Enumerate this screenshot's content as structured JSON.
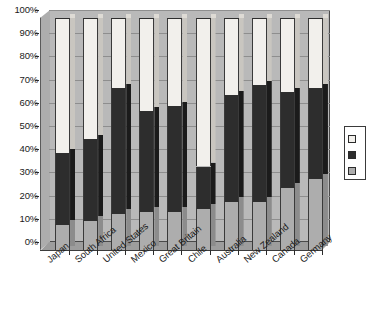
{
  "chart_data": {
    "type": "bar",
    "subtype": "stacked-100-percent",
    "title": "",
    "xlabel": "",
    "ylabel": "",
    "ylim": [
      0,
      100
    ],
    "yticks": [
      "0%",
      "10%",
      "20%",
      "30%",
      "40%",
      "50%",
      "60%",
      "70%",
      "80%",
      "90%",
      "100%"
    ],
    "ytick_values": [
      0,
      10,
      20,
      30,
      40,
      50,
      60,
      70,
      80,
      90,
      100
    ],
    "grid": true,
    "legend_position": "right",
    "categories": [
      "Japan",
      "South Africa",
      "United States",
      "Mexico",
      "Great Britain",
      "Chile",
      "Australia",
      "New Zealand",
      "Canada",
      "Germany"
    ],
    "series": [
      {
        "name": "",
        "swatch": "gray",
        "color": "#adadad",
        "values": [
          11,
          13,
          16,
          17,
          17,
          18,
          21,
          21,
          27,
          31
        ]
      },
      {
        "name": "",
        "swatch": "black",
        "color": "#2d2d2d",
        "values": [
          31,
          35,
          54,
          43,
          45,
          18,
          46,
          50,
          41,
          39
        ]
      },
      {
        "name": "",
        "swatch": "white",
        "color": "#f2f0ec",
        "values": [
          58,
          52,
          30,
          40,
          38,
          64,
          33,
          29,
          32,
          30
        ]
      }
    ],
    "cumulative_tops": {
      "gray": [
        11,
        13,
        16,
        17,
        17,
        18,
        21,
        21,
        27,
        31
      ],
      "black": [
        42,
        48,
        70,
        60,
        62,
        36,
        67,
        71,
        68,
        70
      ],
      "white": [
        100,
        100,
        100,
        100,
        100,
        100,
        100,
        100,
        100,
        100
      ]
    }
  },
  "legend": {
    "items": [
      {
        "swatch": "white",
        "label": ""
      },
      {
        "swatch": "black",
        "label": ""
      },
      {
        "swatch": "gray",
        "label": ""
      }
    ]
  },
  "colors": {
    "plot_background": "#b9b9b9",
    "floor": "#9d9d9d",
    "gridline": "#8e8e8e",
    "axis": "#2b2b2b",
    "series_white": "#f2f0ec",
    "series_black": "#2d2d2d",
    "series_gray": "#adadad",
    "page_background": "#ffffff"
  }
}
